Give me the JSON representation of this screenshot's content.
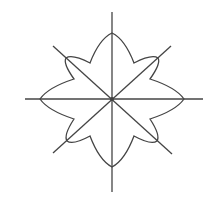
{
  "diagram": {
    "stroke_color": "#444444",
    "background": "#ffffff",
    "center": {
      "x": 112,
      "y": 99
    },
    "axes": [
      {
        "name": "vertical",
        "x1": 112,
        "y1": 12,
        "x2": 112,
        "y2": 192
      },
      {
        "name": "horizontal",
        "x1": 25,
        "y1": 99,
        "x2": 203,
        "y2": 99
      },
      {
        "name": "diagonal-main",
        "x1": 53,
        "y1": 46,
        "x2": 172,
        "y2": 154
      },
      {
        "name": "diagonal-anti",
        "x1": 171,
        "y1": 46,
        "x2": 53,
        "y2": 153
      }
    ],
    "petal_tips": [
      {
        "name": "top",
        "x": 112,
        "y": 33
      },
      {
        "name": "top-right",
        "x": 158,
        "y": 58
      },
      {
        "name": "right",
        "x": 184,
        "y": 99
      },
      {
        "name": "bottom-right",
        "x": 157,
        "y": 141
      },
      {
        "name": "bottom",
        "x": 112,
        "y": 167
      },
      {
        "name": "bottom-left",
        "x": 67,
        "y": 141
      },
      {
        "name": "left",
        "x": 40,
        "y": 99
      },
      {
        "name": "top-left",
        "x": 66,
        "y": 58
      }
    ],
    "notches": [
      {
        "x": 134,
        "y": 63
      },
      {
        "x": 150,
        "y": 79
      },
      {
        "x": 150,
        "y": 119
      },
      {
        "x": 134,
        "y": 136
      },
      {
        "x": 90,
        "y": 136
      },
      {
        "x": 74,
        "y": 119
      },
      {
        "x": 74,
        "y": 79
      },
      {
        "x": 90,
        "y": 63
      }
    ]
  }
}
